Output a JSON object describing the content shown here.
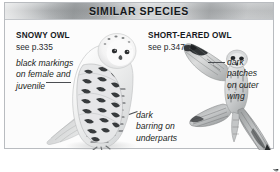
{
  "panel": {
    "header_title": "SIMILAR SPECIES",
    "border_color": "#b9bcc0",
    "header_color": "#b3b6b8",
    "background_color": "#fcfcfc"
  },
  "species": [
    {
      "name": "SNOWY OWL",
      "reference": "see p.335",
      "pose": "perched-standing",
      "illustration_name": "snowy-owl-illustration"
    },
    {
      "name": "SHORT-EARED OWL",
      "reference": "see p.347",
      "pose": "in-flight-wings-spread",
      "illustration_name": "short-eared-owl-illustration"
    }
  ],
  "callouts": [
    {
      "id": "black-markings",
      "lines": [
        "black markings",
        "on female and",
        "juvenile"
      ],
      "target": "snowy-owl-illustration"
    },
    {
      "id": "dark-barring",
      "lines": [
        "dark",
        "barring on",
        "underparts"
      ],
      "target": "snowy-owl-illustration"
    },
    {
      "id": "dark-patches",
      "lines": [
        "dark",
        "patches",
        "on outer",
        "wing"
      ],
      "target": "short-eared-owl-illustration"
    }
  ]
}
